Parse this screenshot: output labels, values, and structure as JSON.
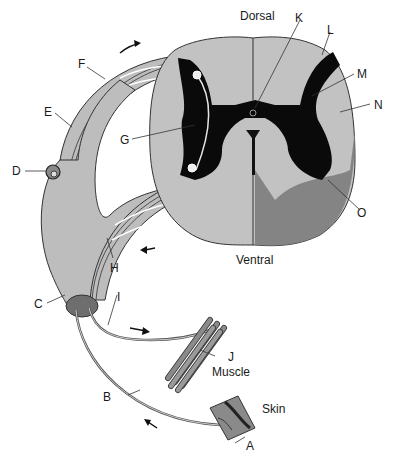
{
  "diagram": {
    "orientation": {
      "top": "Dorsal",
      "bottom": "Ventral"
    },
    "structure_labels": {
      "muscle": "Muscle",
      "skin": "Skin"
    },
    "letter_labels": {
      "A": "A",
      "B": "B",
      "C": "C",
      "D": "D",
      "E": "E",
      "F": "F",
      "G": "G",
      "H": "H",
      "I": "I",
      "J": "J",
      "K": "K",
      "L": "L",
      "M": "M",
      "N": "N",
      "O": "O"
    },
    "colors": {
      "white_matter": "#b4b4b4",
      "white_matter_light": "#c8c8c8",
      "gray_matter": "#0a0a0a",
      "ventral_shade": "#7d7d7d",
      "nerve": "#bdbdbd",
      "outline": "#333333",
      "ganglion_node": "#6e6e6e"
    },
    "arrows": [
      {
        "name": "dorsal-root-direction",
        "direction": "toward cord"
      },
      {
        "name": "ventral-root-direction",
        "direction": "away from cord"
      },
      {
        "name": "motor-direction",
        "direction": "toward muscle"
      },
      {
        "name": "sensory-direction",
        "direction": "toward cord"
      }
    ]
  }
}
